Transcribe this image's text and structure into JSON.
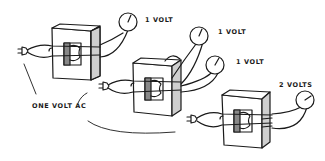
{
  "diagram": {
    "title": "",
    "labels": {
      "meter1": "1 VOLT",
      "meter2": "1 VOLT",
      "meter3": "1 VOLT",
      "meter4": "2 VOLTS",
      "source": "ONE VOLT AC"
    },
    "components": [
      {
        "id": "transformer-1",
        "type": "transformer",
        "meters": [
          "meter1"
        ]
      },
      {
        "id": "transformer-2",
        "type": "transformer",
        "meters": [
          "meter2",
          "meter3"
        ]
      },
      {
        "id": "transformer-3",
        "type": "transformer",
        "meters": [
          "meter4"
        ]
      }
    ],
    "colors": {
      "ink": "#1a1a1a",
      "shade": "#cfcfcf",
      "background": "#ffffff"
    }
  }
}
